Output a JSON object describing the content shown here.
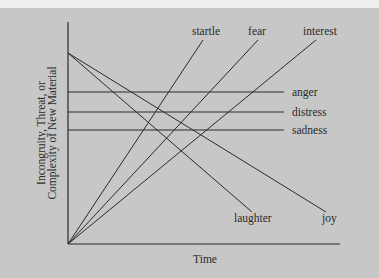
{
  "diagram": {
    "y_axis_label": [
      "Incongruity, Threat, or",
      "Complexity of New Material"
    ],
    "x_axis_label": "Time",
    "rising_lines": [
      {
        "label": "startle"
      },
      {
        "label": "fear"
      },
      {
        "label": "interest"
      }
    ],
    "flat_lines": [
      {
        "label": "anger"
      },
      {
        "label": "distress"
      },
      {
        "label": "sadness"
      }
    ],
    "falling_lines": [
      {
        "label": "laughter"
      },
      {
        "label": "joy"
      }
    ],
    "colors": {
      "background": "#c7c7c7",
      "line": "#2a2a2a",
      "top_strip": "#efefef"
    }
  }
}
